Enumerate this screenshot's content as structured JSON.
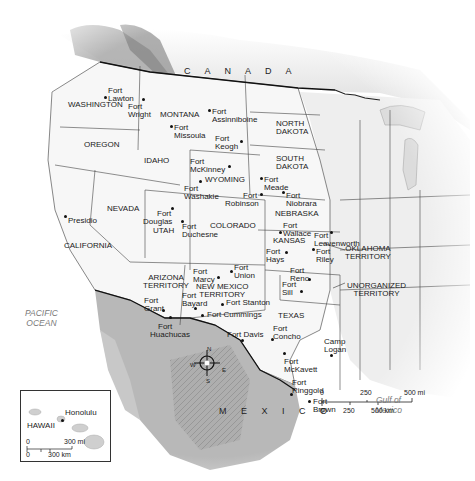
{
  "countries": {
    "canada": "C A N A D A",
    "mexico": "M E X I C O"
  },
  "water": {
    "pacific_line1": "PACIFIC",
    "pacific_line2": "OCEAN",
    "gulf_line1": "Gulf of",
    "gulf_line2": "Mexico"
  },
  "states": {
    "washington": "WASHINGTON",
    "oregon": "OREGON",
    "california": "CALIFORNIA",
    "nevada": "NEVADA",
    "idaho": "IDAHO",
    "montana": "MONTANA",
    "wyoming": "WYOMING",
    "utah": "UTAH",
    "colorado": "COLORADO",
    "north_dakota_1": "NORTH",
    "north_dakota_2": "DAKOTA",
    "south_dakota_1": "SOUTH",
    "south_dakota_2": "DAKOTA",
    "nebraska": "NEBRASKA",
    "kansas": "KANSAS",
    "arizona_1": "ARIZONA",
    "arizona_2": "TERRITORY",
    "new_mexico_1": "NEW MEXICO",
    "new_mexico_2": "TERRITORY",
    "texas": "TEXAS",
    "oklahoma_1": "OKLAHOMA",
    "oklahoma_2": "TERRITORY",
    "unorganized_1": "UNORGANIZED",
    "unorganized_2": "TERRITORY",
    "hawaii": "HAWAII"
  },
  "forts": [
    {
      "l1": "Fort",
      "l2": "Lawton"
    },
    {
      "l1": "Fort",
      "l2": "Wright"
    },
    {
      "l1": "Fort",
      "l2": "Missoula"
    },
    {
      "l1": "Fort",
      "l2": "Assinniboine"
    },
    {
      "l1": "Fort",
      "l2": "Keogh"
    },
    {
      "l1": "Fort",
      "l2": "McKinney"
    },
    {
      "l1": "Fort",
      "l2": "Washakie"
    },
    {
      "l1": "Fort",
      "l2": "Meade"
    },
    {
      "l1": "Fort",
      "l2": "Robinson"
    },
    {
      "l1": "Fort",
      "l2": "Niobrara"
    },
    {
      "l1": "Presidio",
      "l2": ""
    },
    {
      "l1": "Fort",
      "l2": "Douglas"
    },
    {
      "l1": "Fort",
      "l2": "Duchesne"
    },
    {
      "l1": "Fort",
      "l2": "Wallace"
    },
    {
      "l1": "Fort",
      "l2": "Leavenworth"
    },
    {
      "l1": "Fort",
      "l2": "Hays"
    },
    {
      "l1": "Fort",
      "l2": "Riley"
    },
    {
      "l1": "Fort",
      "l2": "Marcy"
    },
    {
      "l1": "Fort",
      "l2": "Union"
    },
    {
      "l1": "Fort",
      "l2": "Reno"
    },
    {
      "l1": "Fort",
      "l2": "Sill"
    },
    {
      "l1": "Fort",
      "l2": "Grant"
    },
    {
      "l1": "Fort",
      "l2": "Bayard"
    },
    {
      "l1": "Fort Stanton",
      "l2": ""
    },
    {
      "l1": "Fort Cummings",
      "l2": ""
    },
    {
      "l1": "Fort",
      "l2": "Huachucas"
    },
    {
      "l1": "Fort Davis",
      "l2": ""
    },
    {
      "l1": "Fort",
      "l2": "Concho"
    },
    {
      "l1": "Camp",
      "l2": "Logan"
    },
    {
      "l1": "Fort",
      "l2": "McKavett"
    },
    {
      "l1": "Fort",
      "l2": "Ringgold"
    },
    {
      "l1": "Fort",
      "l2": "Brown"
    }
  ],
  "hawaii_inset": {
    "city": "Honolulu",
    "label": "HAWAII",
    "scale_mi_0": "0",
    "scale_mi_max": "300 mi",
    "scale_km_0": "0",
    "scale_km_max": "300 km"
  },
  "scale_bar": {
    "mi": [
      "0",
      "250",
      "500 mi"
    ],
    "km": [
      "0",
      "250",
      "500 km"
    ]
  },
  "compass": {
    "n": "N",
    "s": "S",
    "e": "E",
    "w": "W"
  }
}
